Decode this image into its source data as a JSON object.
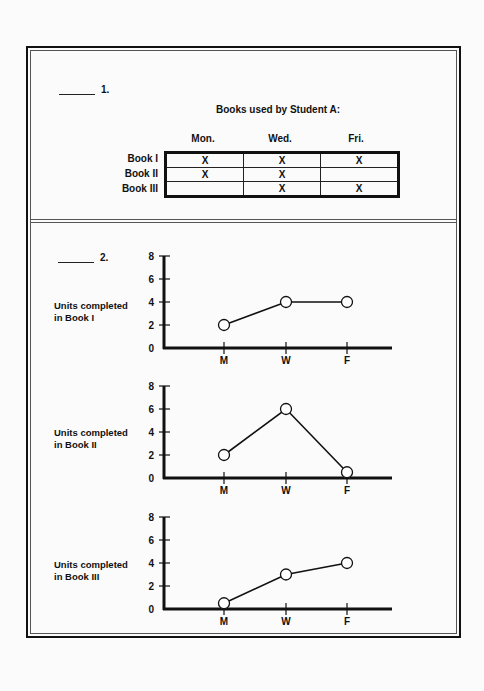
{
  "question1": {
    "number": "1.",
    "title": "Books used by Student A:",
    "columns": [
      "Mon.",
      "Wed.",
      "Fri."
    ],
    "rows": [
      {
        "label": "Book I",
        "cells": [
          "X",
          "X",
          "X"
        ]
      },
      {
        "label": "Book II",
        "cells": [
          "X",
          "X",
          ""
        ]
      },
      {
        "label": "Book III",
        "cells": [
          "",
          "X",
          "X"
        ]
      }
    ]
  },
  "question2": {
    "number": "2.",
    "charts": [
      {
        "ylabel_line1": "Units completed",
        "ylabel_line2": "in Book I"
      },
      {
        "ylabel_line1": "Units completed",
        "ylabel_line2": "in Book II"
      },
      {
        "ylabel_line1": "Units completed",
        "ylabel_line2": "in Book III"
      }
    ]
  },
  "chart_data": [
    {
      "type": "line",
      "title": "",
      "xlabel": "",
      "ylabel": "Units completed in Book I",
      "categories": [
        "M",
        "W",
        "F"
      ],
      "values": [
        2,
        4,
        4
      ],
      "yticks": [
        0,
        2,
        4,
        6,
        8
      ],
      "ylim": [
        0,
        8
      ],
      "grid": false,
      "marker": "open-circle"
    },
    {
      "type": "line",
      "title": "",
      "xlabel": "",
      "ylabel": "Units completed in Book II",
      "categories": [
        "M",
        "W",
        "F"
      ],
      "values": [
        2,
        6,
        0.5
      ],
      "yticks": [
        0,
        2,
        4,
        6,
        8
      ],
      "ylim": [
        0,
        8
      ],
      "grid": false,
      "marker": "open-circle"
    },
    {
      "type": "line",
      "title": "",
      "xlabel": "",
      "ylabel": "Units completed in Book III",
      "categories": [
        "M",
        "W",
        "F"
      ],
      "values": [
        0.5,
        3,
        4
      ],
      "yticks": [
        0,
        2,
        4,
        6,
        8
      ],
      "ylim": [
        0,
        8
      ],
      "grid": false,
      "marker": "open-circle"
    }
  ]
}
